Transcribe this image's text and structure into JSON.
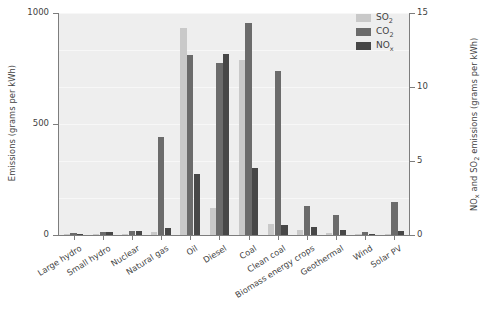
{
  "chart_data": {
    "type": "bar",
    "title": "",
    "categories": [
      "Large hydro",
      "Small hydro",
      "Nuclear",
      "Natural gas",
      "Oil",
      "Diesel",
      "Coal",
      "Clean coal",
      "Biomass energy crops",
      "Geothermal",
      "Wind",
      "Solar PV"
    ],
    "series": [
      {
        "name": "SO2",
        "label": "SO₂",
        "color": "#c9c9c9",
        "axis": "right",
        "units": "grams per kWh",
        "values": [
          0.05,
          0.08,
          0.1,
          0.2,
          14.0,
          1.85,
          11.8,
          0.75,
          0.35,
          0.15,
          0.05,
          0.1
        ]
      },
      {
        "name": "CO2",
        "label": "CO₂",
        "color": "#6b6b6b",
        "axis": "left",
        "units": "grams per kWh",
        "values": [
          10,
          14,
          16,
          440,
          810,
          775,
          955,
          740,
          130,
          90,
          15,
          150
        ]
      },
      {
        "name": "NOx",
        "label": "NOₓ",
        "color": "#474747",
        "axis": "right",
        "units": "grams per kWh",
        "values": [
          0.1,
          0.2,
          0.25,
          0.5,
          4.1,
          12.2,
          4.5,
          0.65,
          0.55,
          0.35,
          0.1,
          0.3
        ]
      }
    ],
    "left_axis": {
      "label": "Emissions (grams per kWh)",
      "ticks": [
        0,
        500,
        1000
      ],
      "ticklabels": [
        "0",
        "500",
        "1000"
      ],
      "ylim": [
        0,
        1000
      ]
    },
    "right_axis": {
      "label": "NOₓ and SO₂ emissions (grams per kWh)",
      "ticks": [
        0,
        5,
        10,
        15
      ],
      "ticklabels": [
        "0",
        "5",
        "10",
        "15"
      ],
      "ylim": [
        0,
        15
      ]
    },
    "legend": {
      "position": "top-right",
      "entries": [
        "SO₂",
        "CO₂",
        "NOₓ"
      ]
    },
    "grid": true,
    "plot_background": "#eeeeee"
  }
}
